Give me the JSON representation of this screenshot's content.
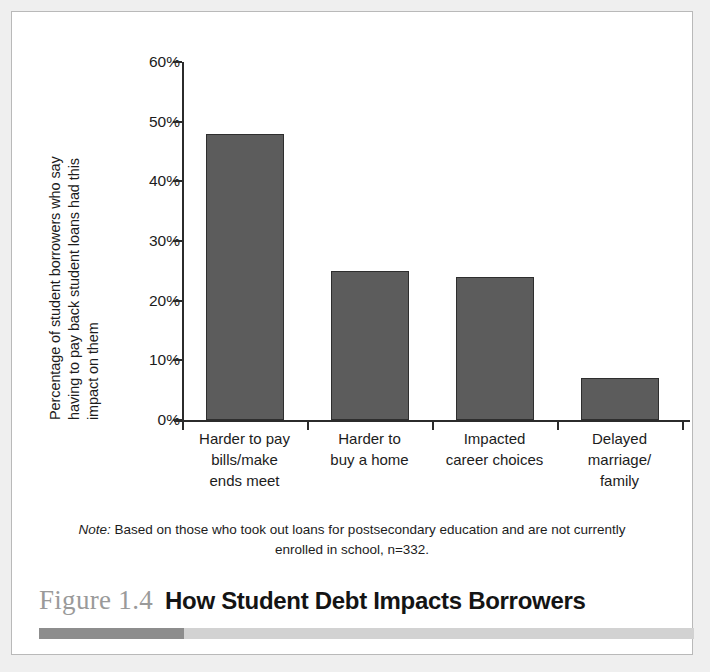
{
  "figure": {
    "number": "Figure 1.4",
    "title": "How Student Debt Impacts Borrowers",
    "note_label": "Note:",
    "note_text": " Based on those who took out loans for postsecondary education and are not currently enrolled in school, n=332."
  },
  "y_axis_title_lines": [
    "Percentage of student borrowers who say",
    "having to pay back student loans had this",
    "impact on them"
  ],
  "colors": {
    "bar_fill": "#5c5c5c",
    "bar_border": "#2e2e2e",
    "axis": "#2b2b2b",
    "figure_number": "#9a9a9a",
    "rule_dark": "#8d8d8d",
    "rule_light": "#d2d2d2",
    "page_background": "#efefef",
    "figure_background": "#ffffff"
  },
  "chart_data": {
    "type": "bar",
    "title": "How Student Debt Impacts Borrowers",
    "xlabel": "",
    "ylabel": "Percentage of student borrowers who say having to pay back student loans had this impact on them",
    "categories": [
      "Harder to pay bills/make ends meet",
      "Harder to buy a home",
      "Impacted career choices",
      "Delayed marriage/family"
    ],
    "category_lines": [
      [
        "Harder to pay",
        "bills/make",
        "ends meet"
      ],
      [
        "Harder to",
        "buy a home"
      ],
      [
        "Impacted",
        "career choices"
      ],
      [
        "Delayed",
        "marriage/",
        "family"
      ]
    ],
    "values": [
      48,
      25,
      24,
      7
    ],
    "value_labels": [
      "48%",
      "25%",
      "24%",
      "7%"
    ],
    "ylim": [
      0,
      60
    ],
    "yticks": [
      0,
      10,
      20,
      30,
      40,
      50,
      60
    ],
    "ytick_labels": [
      "0%",
      "10%",
      "20%",
      "30%",
      "40%",
      "50%",
      "60%"
    ],
    "grid": false,
    "legend": false,
    "note": "Note: Based on those who took out loans for postsecondary education and are not currently enrolled in school, n=332."
  }
}
